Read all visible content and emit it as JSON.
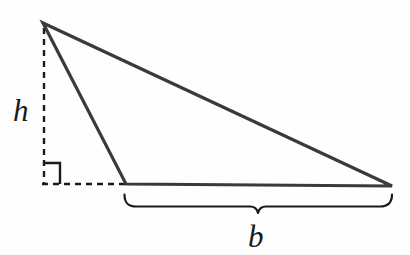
{
  "figure": {
    "kind": "geometry-diagram",
    "background_color": "#fefefe",
    "stroke_color": "#3a3a3a",
    "guide_color": "#1a1a1a",
    "label_color": "#1a1a1a"
  },
  "labels": {
    "height": "h",
    "base": "b"
  },
  "chart_data": {
    "type": "diagram",
    "title": "",
    "elements": {
      "triangle": {
        "name": "triangle",
        "stroke": "#3a3a3a",
        "stroke_width": 3.2,
        "fill": "none",
        "vertices": [
          {
            "name": "apex",
            "x": 43,
            "y": 23
          },
          {
            "name": "base-left",
            "x": 126,
            "y": 184
          },
          {
            "name": "base-right",
            "x": 392,
            "y": 186
          }
        ]
      },
      "height_line": {
        "name": "height-dashed-line",
        "style": "dashed",
        "stroke": "#1a1a1a",
        "stroke_width": 2.4,
        "dash": "6 5",
        "x1": 44,
        "y1": 28,
        "x2": 44,
        "y2": 184
      },
      "extension_line": {
        "name": "base-extension-dashed-line",
        "style": "dashed",
        "stroke": "#1a1a1a",
        "stroke_width": 2.4,
        "dash": "6 5",
        "x1": 42,
        "y1": 184,
        "x2": 126,
        "y2": 184
      },
      "right_angle_marker": {
        "name": "right-angle-marker",
        "stroke": "#1a1a1a",
        "stroke_width": 2.4,
        "points": [
          {
            "x": 44,
            "y": 163
          },
          {
            "x": 60,
            "y": 163
          },
          {
            "x": 60,
            "y": 184
          }
        ]
      },
      "base_brace": {
        "name": "base-brace",
        "stroke": "#1a1a1a",
        "stroke_width": 2.2,
        "fill": "none",
        "left_x": 124,
        "right_x": 392,
        "tip_y": 194,
        "body_y": 206,
        "center_x": 258,
        "center_y": 213
      }
    },
    "annotations": [
      {
        "name": "height-label",
        "text": "h",
        "x": 25,
        "y": 112,
        "italic": true
      },
      {
        "name": "base-label",
        "text": "b",
        "x": 258,
        "y": 237,
        "italic": true
      }
    ]
  }
}
